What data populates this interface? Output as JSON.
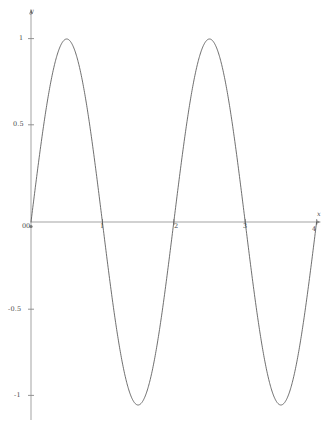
{
  "chart_data": {
    "type": "line",
    "title": "",
    "subtitle": "",
    "xlabel": "x",
    "ylabel": "y",
    "xlim": [
      0,
      4
    ],
    "ylim": [
      -1,
      1
    ],
    "grid": false,
    "legend": "none",
    "xticks": [
      "0",
      "1",
      "2",
      "3",
      "4"
    ],
    "xtick_values": [
      0,
      1,
      2,
      3,
      4
    ],
    "yticks": [
      "-1",
      "-0.5",
      "0",
      "0.5",
      "1"
    ],
    "ytick_values": [
      -1,
      -0.5,
      0,
      0.5,
      1
    ],
    "series": [
      {
        "name": "sin(pi*x)",
        "color": "#555555",
        "x": [
          0,
          0.1,
          0.2,
          0.3,
          0.4,
          0.5,
          0.6,
          0.7,
          0.8,
          0.9,
          1,
          1.1,
          1.2,
          1.3,
          1.4,
          1.5,
          1.6,
          1.7,
          1.8,
          1.9,
          2,
          2.1,
          2.2,
          2.3,
          2.4,
          2.5,
          2.6,
          2.7,
          2.8,
          2.9,
          3,
          3.1,
          3.2,
          3.3,
          3.4,
          3.5,
          3.6,
          3.7,
          3.8,
          3.9,
          4
        ],
        "y": [
          0,
          0.309,
          0.588,
          0.809,
          0.951,
          1,
          0.951,
          0.809,
          0.588,
          0.309,
          0,
          -0.309,
          -0.588,
          -0.809,
          -0.951,
          -1,
          -0.951,
          -0.809,
          -0.588,
          -0.309,
          0,
          0.309,
          0.588,
          0.809,
          0.951,
          1,
          0.951,
          0.809,
          0.588,
          0.309,
          0,
          -0.309,
          -0.588,
          -0.809,
          -0.951,
          -1,
          -0.951,
          -0.809,
          -0.588,
          -0.309,
          0
        ]
      }
    ],
    "annotations": []
  },
  "axes": {
    "x_name": "x",
    "y_name": "y",
    "axis_color": "#888888",
    "curve_color": "#555555"
  },
  "ticks": {
    "x": [
      {
        "label": "0"
      },
      {
        "label": "1"
      },
      {
        "label": "2"
      },
      {
        "label": "3"
      },
      {
        "label": "4"
      }
    ],
    "y": [
      {
        "label": "1"
      },
      {
        "label": "0.5"
      },
      {
        "label": "0"
      },
      {
        "label": "-0.5"
      },
      {
        "label": "-1"
      }
    ]
  }
}
